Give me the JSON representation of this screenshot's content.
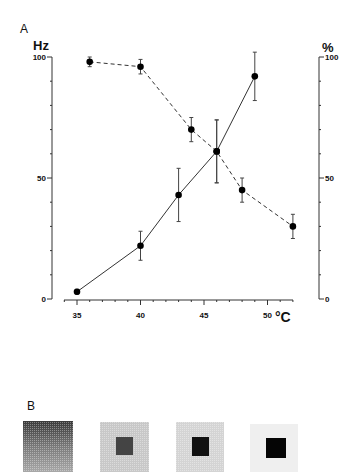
{
  "panels": {
    "a_label": "A",
    "b_label": "B"
  },
  "chart_data": {
    "type": "line",
    "title": "",
    "xlabel": "°C",
    "ylabel": "Hz",
    "ylabel_right": "%",
    "xlim": [
      34,
      53
    ],
    "ylim": [
      0,
      100
    ],
    "ylim_right": [
      0,
      100
    ],
    "x_ticks": [
      35,
      40,
      45,
      50
    ],
    "x_tick_labels": [
      "35",
      "40",
      "45",
      "50"
    ],
    "y_ticks": [
      0,
      50,
      100
    ],
    "y_tick_labels": [
      "0",
      "50",
      "100"
    ],
    "y_right_ticks": [
      0,
      50,
      100
    ],
    "y_right_tick_labels": [
      "0",
      "50",
      "100"
    ],
    "grid": false,
    "legend": null,
    "series": [
      {
        "name": "Firing rate (Hz)",
        "axis": "left",
        "style": "solid",
        "marker": "filled-circle",
        "x": [
          35,
          40,
          43,
          46,
          49
        ],
        "y": [
          3,
          22,
          43,
          61,
          92
        ],
        "error": [
          1,
          6,
          11,
          13,
          10
        ]
      },
      {
        "name": "Percentage (%)",
        "axis": "right",
        "style": "dashed",
        "marker": "filled-circle",
        "x": [
          36,
          40,
          44,
          46,
          48,
          52
        ],
        "y": [
          98,
          96,
          70,
          61,
          45,
          30
        ],
        "error": [
          2,
          3,
          5,
          13,
          5,
          5
        ]
      }
    ]
  },
  "panel_b": {
    "squares": [
      {
        "background": "gradient-dark",
        "inner": null
      },
      {
        "background": "#c8c8c8",
        "inner": "#444444"
      },
      {
        "background": "#d4d4d4",
        "inner": "#111111"
      },
      {
        "background": "#efefef",
        "inner": "#050505"
      }
    ]
  }
}
